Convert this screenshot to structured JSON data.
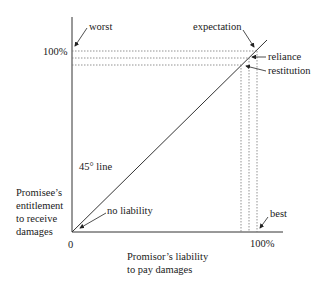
{
  "diagram": {
    "y_axis_label_lines": [
      "Promisee’s",
      "entitlement",
      "to receive",
      "damages"
    ],
    "x_axis_label_lines": [
      "Promisor’s liability",
      "to pay damages"
    ],
    "origin_label": "0",
    "y_max_label": "100%",
    "x_max_label": "100%",
    "diagonal_label": "45° line",
    "annotations": {
      "worst": "worst",
      "expectation": "expectation",
      "reliance": "reliance",
      "restitution": "restitution",
      "no_liability": "no liability",
      "best": "best"
    },
    "colors": {
      "line": "#333333",
      "dotted": "#777777",
      "text": "#1a1a1a"
    }
  }
}
